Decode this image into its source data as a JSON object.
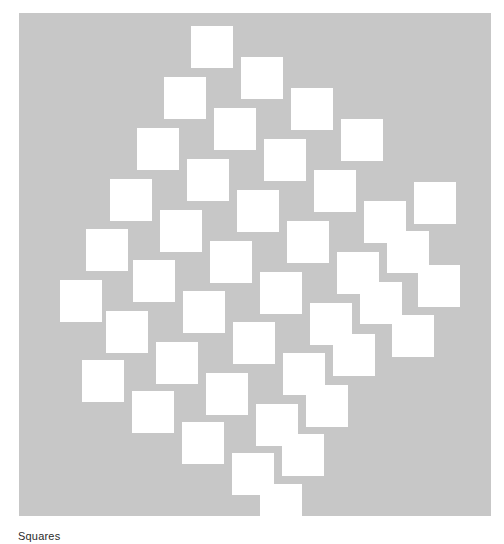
{
  "figure": {
    "kind": "geometric-pattern",
    "name": "tilted-square-lattice",
    "caption": "Squares",
    "caption_visible_fragment": "Squares",
    "caption_clipped_at_bottom": true
  },
  "canvas": {
    "x": 19,
    "y": 13,
    "width": 472,
    "height": 503,
    "background_color": "#c7c7c7",
    "page_background_color": "#ffffff"
  },
  "pattern_data": {
    "type": "lattice",
    "shape": "square",
    "fill_color": "#ffffff",
    "square_width": 42,
    "square_height": 42,
    "count": 38,
    "lattice_basis_v1": [
      50,
      31
    ],
    "lattice_basis_v2": [
      -27,
      51
    ],
    "overall_outline": "rhombus",
    "squares": [
      {
        "x": 191,
        "y": 26
      },
      {
        "x": 241,
        "y": 57
      },
      {
        "x": 291,
        "y": 88
      },
      {
        "x": 341,
        "y": 119
      },
      {
        "x": 164,
        "y": 77
      },
      {
        "x": 214,
        "y": 108
      },
      {
        "x": 264,
        "y": 139
      },
      {
        "x": 314,
        "y": 170
      },
      {
        "x": 364,
        "y": 201
      },
      {
        "x": 414,
        "y": 182
      },
      {
        "x": 137,
        "y": 128
      },
      {
        "x": 187,
        "y": 159
      },
      {
        "x": 237,
        "y": 190
      },
      {
        "x": 287,
        "y": 221
      },
      {
        "x": 337,
        "y": 252
      },
      {
        "x": 387,
        "y": 231
      },
      {
        "x": 110,
        "y": 179
      },
      {
        "x": 160,
        "y": 210
      },
      {
        "x": 210,
        "y": 241
      },
      {
        "x": 260,
        "y": 272
      },
      {
        "x": 310,
        "y": 303
      },
      {
        "x": 360,
        "y": 282
      },
      {
        "x": 86,
        "y": 229
      },
      {
        "x": 133,
        "y": 260
      },
      {
        "x": 183,
        "y": 291
      },
      {
        "x": 233,
        "y": 322
      },
      {
        "x": 283,
        "y": 353
      },
      {
        "x": 333,
        "y": 334
      },
      {
        "x": 60,
        "y": 280
      },
      {
        "x": 106,
        "y": 311
      },
      {
        "x": 156,
        "y": 342
      },
      {
        "x": 206,
        "y": 373
      },
      {
        "x": 256,
        "y": 404
      },
      {
        "x": 306,
        "y": 385
      },
      {
        "x": 82,
        "y": 360
      },
      {
        "x": 132,
        "y": 391
      },
      {
        "x": 182,
        "y": 422
      },
      {
        "x": 232,
        "y": 453
      },
      {
        "x": 282,
        "y": 434
      },
      {
        "x": 260,
        "y": 484
      },
      {
        "x": 392,
        "y": 315
      },
      {
        "x": 418,
        "y": 265
      }
    ]
  },
  "caption": {
    "text": "Squares",
    "x": 18,
    "y": 531,
    "font_size": 11,
    "color": "#2b2b2b"
  }
}
